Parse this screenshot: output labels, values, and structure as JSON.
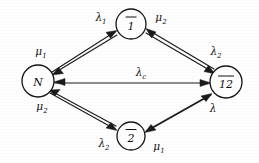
{
  "diagram": {
    "type": "state-transition-graph",
    "background_color": "#fefefe",
    "ink_color": "#1b1b1b",
    "nodes": [
      {
        "id": "N",
        "label": "N",
        "overbar": false,
        "overbar_segments": 0,
        "cx": 38,
        "cy": 81,
        "r": 16
      },
      {
        "id": "1bar",
        "label": "1",
        "overbar": true,
        "overbar_segments": 1,
        "cx": 131,
        "cy": 24,
        "r": 15
      },
      {
        "id": "2bar",
        "label": "2",
        "overbar": true,
        "overbar_segments": 1,
        "cx": 131,
        "cy": 136,
        "r": 14
      },
      {
        "id": "12bar",
        "label": "12",
        "overbar": true,
        "overbar_segments": 2,
        "cx": 226,
        "cy": 82,
        "r": 16
      }
    ],
    "edges": [
      {
        "id": "n-to-1bar",
        "from": "N",
        "to": "1bar",
        "label": "λ",
        "sub": "1",
        "label_x": 101,
        "label_y": 21
      },
      {
        "id": "1bar-to-n",
        "from": "1bar",
        "to": "N",
        "label": "μ",
        "sub": "1",
        "label_x": 41,
        "label_y": 55
      },
      {
        "id": "1bar-to-12bar",
        "from": "1bar",
        "to": "12bar",
        "label": "λ",
        "sub": "2",
        "label_x": 216,
        "label_y": 55
      },
      {
        "id": "12bar-to-1bar",
        "from": "12bar",
        "to": "1bar",
        "label": "μ",
        "sub": "2",
        "label_x": 161,
        "label_y": 21
      },
      {
        "id": "n-to-12bar",
        "from": "N",
        "to": "12bar",
        "label": "λ",
        "sub": "c",
        "label_x": 141,
        "label_y": 76
      },
      {
        "id": "n-to-2bar",
        "from": "N",
        "to": "2bar",
        "label": "λ",
        "sub": "2",
        "label_x": 104,
        "label_y": 147
      },
      {
        "id": "2bar-to-n",
        "from": "2bar",
        "to": "N",
        "label": "μ",
        "sub": "2",
        "label_x": 42,
        "label_y": 110
      },
      {
        "id": "2bar-to-12bar",
        "from": "2bar",
        "to": "12bar",
        "label": "λ",
        "sub": "",
        "label_x": 213,
        "label_y": 112
      },
      {
        "id": "12bar-to-2bar",
        "from": "12bar",
        "to": "2bar",
        "label": "μ",
        "sub": "1",
        "label_x": 159,
        "label_y": 150
      }
    ],
    "legend_note": ""
  }
}
